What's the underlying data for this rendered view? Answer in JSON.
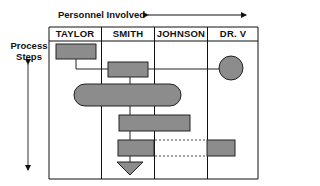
{
  "diagram": {
    "type": "swimlane-process-chart",
    "top_label": "Personnel Involved",
    "side_label_line1": "Process",
    "side_label_line2": "Steps",
    "lanes": [
      {
        "label": "TAYLOR"
      },
      {
        "label": "SMITH"
      },
      {
        "label": "JOHNSON"
      },
      {
        "label": "DR. V"
      }
    ],
    "colors": {
      "shape_fill": "#8c8c8c",
      "line": "#111111",
      "background": "#ffffff"
    },
    "shapes": [
      {
        "id": "step-1",
        "kind": "rectangle",
        "lane": "TAYLOR"
      },
      {
        "id": "step-2",
        "kind": "rectangle",
        "lane": "SMITH"
      },
      {
        "id": "step-3",
        "kind": "circle",
        "lane": "DR. V"
      },
      {
        "id": "step-4",
        "kind": "ellipse",
        "lanes": [
          "TAYLOR",
          "SMITH",
          "JOHNSON"
        ]
      },
      {
        "id": "step-5",
        "kind": "rectangle",
        "lanes": [
          "SMITH",
          "JOHNSON"
        ]
      },
      {
        "id": "step-6",
        "kind": "rectangle",
        "lane": "SMITH"
      },
      {
        "id": "step-7",
        "kind": "rectangle",
        "lane": "DR. V"
      },
      {
        "id": "step-8",
        "kind": "triangle-down",
        "lane": "SMITH"
      }
    ]
  }
}
